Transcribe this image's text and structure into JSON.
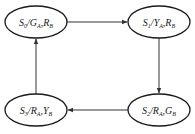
{
  "diagram": {
    "type": "state-transition",
    "nodes": [
      {
        "id": "S0",
        "state": "S",
        "state_sub": "0",
        "sig1": "G",
        "sig1_sub": "A",
        "sig2": "R",
        "sig2_sub": "B",
        "cx": 36,
        "cy": 22
      },
      {
        "id": "S1",
        "state": "S",
        "state_sub": "1",
        "sig1": "Y",
        "sig1_sub": "A",
        "sig2": "R",
        "sig2_sub": "B",
        "cx": 159,
        "cy": 22
      },
      {
        "id": "S2",
        "state": "S",
        "state_sub": "2",
        "sig1": "R",
        "sig1_sub": "A",
        "sig2": "G",
        "sig2_sub": "B",
        "cx": 159,
        "cy": 110
      },
      {
        "id": "S3",
        "state": "S",
        "state_sub": "3",
        "sig1": "R",
        "sig1_sub": "A",
        "sig2": "Y",
        "sig2_sub": "B",
        "cx": 36,
        "cy": 110
      }
    ],
    "edges": [
      {
        "from": "S0",
        "to": "S1",
        "direction": "right"
      },
      {
        "from": "S1",
        "to": "S2",
        "direction": "down"
      },
      {
        "from": "S2",
        "to": "S3",
        "direction": "left"
      },
      {
        "from": "S3",
        "to": "S0",
        "direction": "up"
      }
    ],
    "separator": "/",
    "comma": ","
  },
  "colors": {
    "stroke": "#1a1a1a",
    "edge": "#333333",
    "background": "#ffffff"
  }
}
